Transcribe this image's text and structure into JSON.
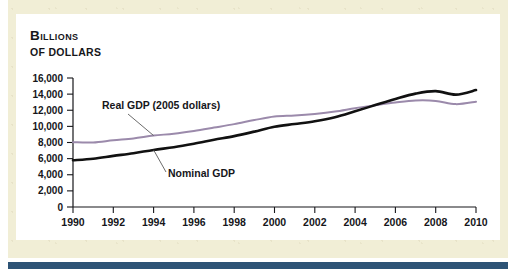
{
  "figure": {
    "title_line1": "Billions",
    "title_line2": "of dollars",
    "band_color": "#f1eed6",
    "rule_color": "#2d5375",
    "panel_color": "#ffffff"
  },
  "chart_data": {
    "type": "line",
    "title": "Billions of dollars",
    "xlabel": "",
    "ylabel": "Billions of dollars",
    "xlim": [
      1990,
      2010
    ],
    "ylim": [
      0,
      16000
    ],
    "ytick_step": 2000,
    "xtick_step": 2,
    "grid": false,
    "legend": "annotated-inline",
    "yticks": [
      "0",
      "2,000",
      "4,000",
      "6,000",
      "8,000",
      "10,000",
      "12,000",
      "14,000",
      "16,000"
    ],
    "xticks": [
      "1990",
      "1992",
      "1994",
      "1996",
      "1998",
      "2000",
      "2002",
      "2004",
      "2006",
      "2008",
      "2010"
    ],
    "x": [
      1990,
      1991,
      1992,
      1993,
      1994,
      1995,
      1996,
      1997,
      1998,
      1999,
      2000,
      2001,
      2002,
      2003,
      2004,
      2005,
      2006,
      2007,
      2008,
      2009,
      2010
    ],
    "series": [
      {
        "name": "Real GDP (2005 dollars)",
        "color": "#9b8aab",
        "label": "Real GDP (2005 dollars)",
        "values": [
          8030,
          8010,
          8280,
          8510,
          8860,
          9090,
          9430,
          9850,
          10280,
          10780,
          11220,
          11350,
          11550,
          11840,
          12260,
          12620,
          12960,
          13210,
          13160,
          12760,
          13060
        ]
      },
      {
        "name": "Nominal GDP",
        "color": "#111111",
        "label": "Nominal GDP",
        "values": [
          5800,
          5990,
          6340,
          6670,
          7080,
          7410,
          7840,
          8330,
          8790,
          9350,
          9950,
          10290,
          10640,
          11140,
          11870,
          12640,
          13400,
          14060,
          14370,
          13940,
          14500
        ]
      }
    ],
    "annotations": [
      {
        "text": "Real GDP (2005 dollars)",
        "target_year": 1994,
        "target_value": 8860
      },
      {
        "text": "Nominal GDP",
        "target_year": 1994,
        "target_value": 7080
      }
    ]
  }
}
